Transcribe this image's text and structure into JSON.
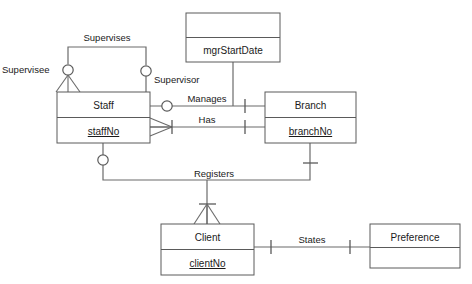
{
  "diagram": {
    "type": "entity-relationship-diagram",
    "notation": "crows-foot",
    "title": "",
    "background_color": "#ffffff",
    "line_color": "#6b6b6b",
    "text_color": "#1a1a1a"
  },
  "entities": [
    {
      "id": "staff",
      "name": "Staff",
      "primary_key": "staffNo",
      "x": 57,
      "y": 92,
      "w": 93,
      "h": 51
    },
    {
      "id": "branch",
      "name": "Branch",
      "primary_key": "branchNo",
      "x": 265,
      "y": 92,
      "w": 91,
      "h": 51
    },
    {
      "id": "mgrstartdate",
      "name": "",
      "primary_key": "mgrStartDate",
      "x": 186,
      "y": 13,
      "w": 94,
      "h": 49
    },
    {
      "id": "client",
      "name": "Client",
      "primary_key": "clientNo",
      "x": 161,
      "y": 224,
      "w": 93,
      "h": 51
    },
    {
      "id": "preference",
      "name": "Preference",
      "primary_key": "",
      "x": 370,
      "y": 224,
      "w": 90,
      "h": 44
    }
  ],
  "relationships": [
    {
      "id": "supervises",
      "label": "Supervises",
      "from": "staff",
      "to": "staff"
    },
    {
      "id": "manages",
      "label": "Manages",
      "from": "staff",
      "to": "branch"
    },
    {
      "id": "has",
      "label": "Has",
      "from": "staff",
      "to": "branch"
    },
    {
      "id": "registers",
      "label": "Registers",
      "from": "staff",
      "to": "branch"
    },
    {
      "id": "states",
      "label": "States",
      "from": "client",
      "to": "preference"
    }
  ],
  "role_labels": [
    {
      "id": "supervisee",
      "label": "Supervisee",
      "x": 2,
      "y": 73
    },
    {
      "id": "supervisor",
      "label": "Supervisor",
      "x": 154,
      "y": 83
    }
  ],
  "relationship_label_positions": {
    "supervises": {
      "x": 107,
      "y": 41
    },
    "manages": {
      "x": 207,
      "y": 99
    },
    "has": {
      "x": 207,
      "y": 120
    },
    "registers": {
      "x": 214,
      "y": 177
    },
    "states": {
      "x": 312,
      "y": 243
    }
  },
  "entity_label_offsets": {
    "name_dy": 16,
    "attr_dy": 42
  }
}
